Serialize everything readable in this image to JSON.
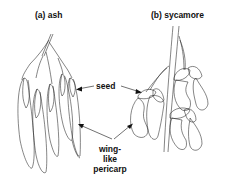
{
  "figure": {
    "panels": [
      {
        "id": "a",
        "label": "(a) ash"
      },
      {
        "id": "b",
        "label": "(b) sycamore"
      }
    ],
    "annotations": {
      "seed": "seed",
      "wing_lines": [
        "wing-",
        "like",
        "pericarp"
      ]
    },
    "colors": {
      "ink": "#222222",
      "background": "#ffffff"
    }
  }
}
